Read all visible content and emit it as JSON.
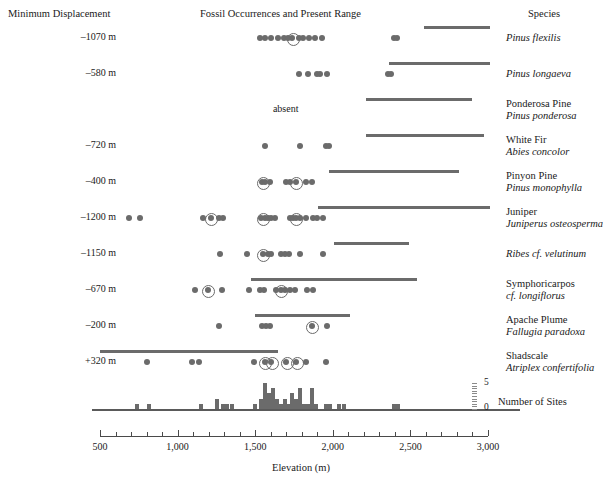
{
  "header": {
    "left": "Minimum Displacement",
    "center": "Fossil Occurrences and Present Range",
    "right": "Species"
  },
  "axis": {
    "title": "Elevation (m)",
    "min": 500,
    "max": 3000,
    "ticks": [
      {
        "value": 500,
        "label": "500"
      },
      {
        "value": 1000,
        "label": "1,000"
      },
      {
        "value": 1500,
        "label": "1,500"
      },
      {
        "value": 2000,
        "label": "2,000"
      },
      {
        "value": 2500,
        "label": "2,500"
      },
      {
        "value": 3000,
        "label": "3,000"
      }
    ],
    "minor_step": 100
  },
  "histogram_axis": {
    "label": "Number of Sites",
    "max_label": "5",
    "min_label": "0",
    "max": 5,
    "min": 0
  },
  "chart_data": {
    "type": "scatter",
    "title": "Fossil Occurrences and Present Range",
    "xlabel": "Elevation (m)",
    "ylabel": "",
    "xlim": [
      500,
      3000
    ],
    "grid": false,
    "legend": "none",
    "rows": [
      {
        "displacement": "–1070 m",
        "common": "",
        "scientific": "Pinus flexilis",
        "absent": false,
        "range": [
          2585,
          3010
        ],
        "fossils": [
          1530,
          1560,
          1600,
          1645,
          1685,
          1710,
          1740,
          1785,
          1810,
          1845,
          1885,
          1930,
          2395,
          2415
        ],
        "ringed": [
          1740
        ]
      },
      {
        "displacement": "–580 m",
        "common": "",
        "scientific": "Pinus longaeva",
        "absent": false,
        "range": [
          2365,
          3010
        ],
        "fossils": [
          1785,
          1840,
          1895,
          1915,
          1960,
          2355,
          2375
        ],
        "ringed": []
      },
      {
        "displacement": "",
        "common": "Ponderosa Pine",
        "scientific": "Pinus ponderosa",
        "absent": true,
        "absent_label": "absent",
        "absent_at": 1730,
        "range": [
          2215,
          2895
        ],
        "fossils": [],
        "ringed": []
      },
      {
        "displacement": "–720 m",
        "common": "White Fir",
        "scientific": "Abies concolor",
        "absent": false,
        "range": [
          2215,
          2975
        ],
        "fossils": [
          1565,
          1790,
          1955,
          1975
        ],
        "ringed": []
      },
      {
        "displacement": "–400 m",
        "common": "Pinyon Pine",
        "scientific": "Pinus monophylla",
        "absent": false,
        "range": [
          1975,
          2815
        ],
        "fossils": [
          1545,
          1565,
          1595,
          1700,
          1725,
          1760,
          1825,
          1865
        ],
        "ringed": [
          1550,
          1760
        ]
      },
      {
        "displacement": "–1200 m",
        "common": "Juniper",
        "scientific": "Juniperus osteosperma",
        "absent": false,
        "range": [
          1905,
          3010
        ],
        "fossils": [
          685,
          755,
          1165,
          1215,
          1265,
          1290,
          1540,
          1565,
          1585,
          1605,
          1630,
          1725,
          1745,
          1765,
          1790,
          1830,
          1875,
          1900,
          1940
        ],
        "ringed": [
          1215,
          1550,
          1760
        ]
      },
      {
        "displacement": "–1150 m",
        "common": "",
        "scientific": "Ribes cf. velutinum",
        "absent": false,
        "range": [
          2005,
          2490
        ],
        "fossils": [
          1275,
          1450,
          1550,
          1580,
          1605,
          1665,
          1690,
          1715,
          1790,
          1940
        ],
        "ringed": [
          1550
        ]
      },
      {
        "displacement": "–670 m",
        "common": "Symphoricarpos",
        "scientific": "cf. longiflorus",
        "absent": false,
        "range": [
          1475,
          2540
        ],
        "fossils": [
          1115,
          1195,
          1285,
          1460,
          1530,
          1555,
          1635,
          1665,
          1690,
          1725,
          1755,
          1835,
          1875
        ],
        "ringed": [
          1195,
          1665
        ]
      },
      {
        "displacement": "–200 m",
        "common": "Apache Plume",
        "scientific": "Fallugia paradoxa",
        "absent": false,
        "range": [
          1500,
          2110
        ],
        "fossils": [
          1265,
          1545,
          1570,
          1595,
          1865,
          1960
        ],
        "ringed": [
          1865
        ]
      },
      {
        "displacement": "+320 m",
        "common": "Shadscale",
        "scientific": "Atriplex confertifolia",
        "absent": false,
        "range": [
          500,
          1645
        ],
        "fossils": [
          800,
          1090,
          1140,
          1490,
          1560,
          1605,
          1700,
          1765,
          1825,
          1955
        ],
        "ringed": [
          1560,
          1605,
          1700,
          1765
        ]
      }
    ],
    "histogram": {
      "bin_width": 25,
      "bins": [
        {
          "elevation": 740,
          "count": 1
        },
        {
          "elevation": 815,
          "count": 1
        },
        {
          "elevation": 1150,
          "count": 1
        },
        {
          "elevation": 1255,
          "count": 2
        },
        {
          "elevation": 1290,
          "count": 1
        },
        {
          "elevation": 1320,
          "count": 1
        },
        {
          "elevation": 1350,
          "count": 1
        },
        {
          "elevation": 1500,
          "count": 1
        },
        {
          "elevation": 1540,
          "count": 2
        },
        {
          "elevation": 1565,
          "count": 5
        },
        {
          "elevation": 1590,
          "count": 3
        },
        {
          "elevation": 1615,
          "count": 4
        },
        {
          "elevation": 1640,
          "count": 2
        },
        {
          "elevation": 1665,
          "count": 1
        },
        {
          "elevation": 1690,
          "count": 2
        },
        {
          "elevation": 1715,
          "count": 1
        },
        {
          "elevation": 1740,
          "count": 3
        },
        {
          "elevation": 1765,
          "count": 2
        },
        {
          "elevation": 1790,
          "count": 4
        },
        {
          "elevation": 1815,
          "count": 1
        },
        {
          "elevation": 1840,
          "count": 1
        },
        {
          "elevation": 1865,
          "count": 4
        },
        {
          "elevation": 1890,
          "count": 1
        },
        {
          "elevation": 1955,
          "count": 1
        },
        {
          "elevation": 1985,
          "count": 1
        },
        {
          "elevation": 2040,
          "count": 1
        },
        {
          "elevation": 2070,
          "count": 1
        },
        {
          "elevation": 2395,
          "count": 1
        },
        {
          "elevation": 2420,
          "count": 1
        }
      ]
    }
  }
}
